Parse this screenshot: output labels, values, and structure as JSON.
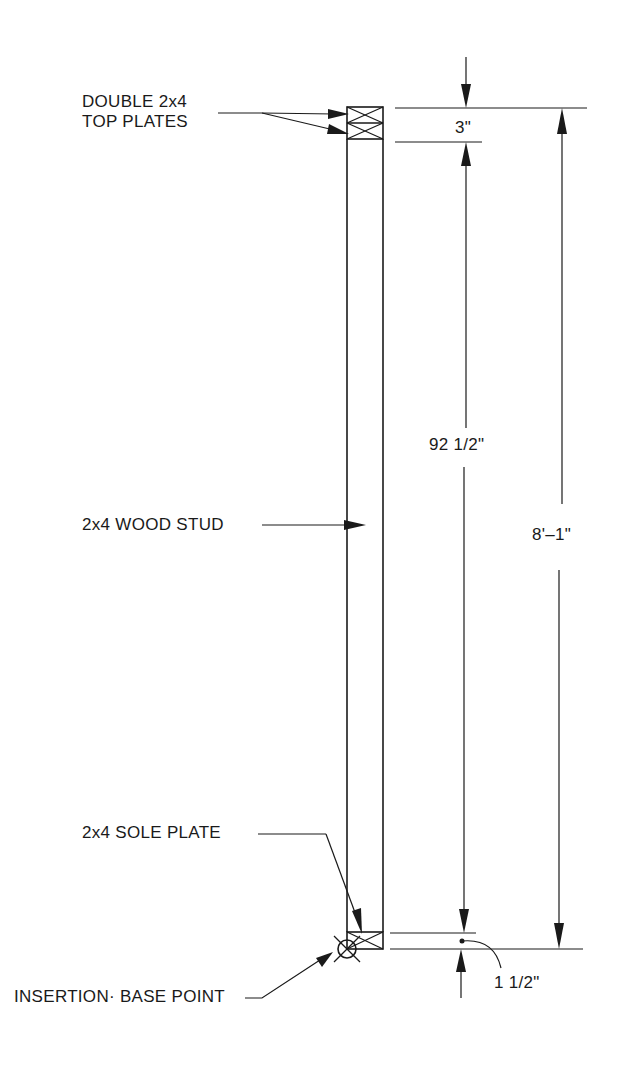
{
  "drawing": {
    "subject": "2x4 wall stud assembly elevation",
    "labels": {
      "top_plates_line1": "DOUBLE 2x4",
      "top_plates_line2": "TOP PLATES",
      "stud": "2x4 WOOD STUD",
      "sole_plate": "2x4 SOLE PLATE",
      "insertion_point": "INSERTION· BASE POINT"
    },
    "dimensions": {
      "top_plates": "3\"",
      "stud_length": "92  1/2\"",
      "overall_height": "8'–1\"",
      "sole_plate": "1  1/2\""
    },
    "colors": {
      "line": "#1a1a1a",
      "background": "#ffffff"
    }
  }
}
